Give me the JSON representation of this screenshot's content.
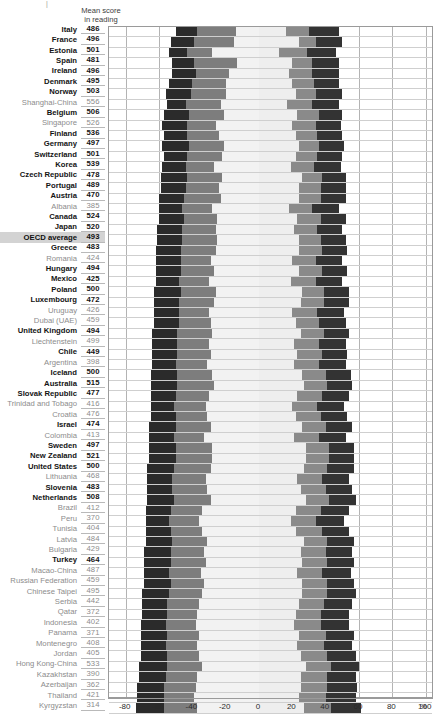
{
  "header": {
    "column_header_line1": "Mean score",
    "column_header_line2": "in reading",
    "corner_mark": "|"
  },
  "axis": {
    "unit_label": "%",
    "ticks": [
      "-80",
      "-60",
      "-40",
      "-20",
      "0",
      "20",
      "40",
      "60",
      "80",
      "100"
    ],
    "min": -90,
    "max": 105
  },
  "chart_data": {
    "type": "bar",
    "title": "Mean score in reading",
    "xlabel": "%",
    "ylabel": "",
    "xlim": [
      -90,
      105
    ],
    "grid": true,
    "legend_position": "none",
    "stacked": "diverging",
    "categories": [
      "Italy",
      "France",
      "Estonia",
      "Spain",
      "Ireland",
      "Denmark",
      "Norway",
      "Shanghai-China",
      "Belgium",
      "Singapore",
      "Finland",
      "Germany",
      "Switzerland",
      "Korea",
      "Czech Republic",
      "Portugal",
      "Austria",
      "Albania",
      "Canada",
      "Japan",
      "OECD average",
      "Greece",
      "Romania",
      "Hungary",
      "Mexico",
      "Poland",
      "Luxembourg",
      "Uruguay",
      "Dubai (UAE)",
      "United Kingdom",
      "Liechtenstein",
      "Chile",
      "Argentina",
      "Iceland",
      "Australia",
      "Slovak Republic",
      "Trinidad and Tobago",
      "Croatia",
      "Israel",
      "Colombia",
      "Sweden",
      "New Zealand",
      "United States",
      "Lithuania",
      "Slovenia",
      "Netherlands",
      "Brazil",
      "Peru",
      "Tunisia",
      "Latvia",
      "Bulgaria",
      "Turkey",
      "Macao-China",
      "Russian Federation",
      "Chinese Taipei",
      "Serbia",
      "Qatar",
      "Indonesia",
      "Panama",
      "Montenegro",
      "Jordan",
      "Hong Kong-China",
      "Kazakhstan",
      "Azerbaijan",
      "Thailand",
      "Kyrgyzstan"
    ],
    "mean_score_in_reading": [
      486,
      496,
      501,
      481,
      496,
      495,
      503,
      556,
      506,
      526,
      536,
      497,
      501,
      539,
      478,
      489,
      470,
      385,
      524,
      520,
      493,
      483,
      424,
      494,
      425,
      500,
      472,
      426,
      459,
      494,
      499,
      449,
      398,
      500,
      515,
      477,
      416,
      476,
      474,
      413,
      497,
      521,
      500,
      468,
      483,
      508,
      412,
      370,
      404,
      484,
      429,
      464,
      487,
      459,
      495,
      442,
      372,
      402,
      371,
      408,
      405,
      533,
      390,
      362,
      421,
      314
    ],
    "series": [
      {
        "name": "left-outer-dark",
        "key": "L1"
      },
      {
        "name": "left-inner-gray",
        "key": "L2"
      },
      {
        "name": "left-light",
        "key": "L3"
      },
      {
        "name": "right-light",
        "key": "R1"
      },
      {
        "name": "right-inner-gray",
        "key": "R2"
      },
      {
        "name": "right-outer-dark",
        "key": "R3"
      }
    ],
    "values": [
      [
        -50,
        -37,
        -14,
        16,
        30,
        48
      ],
      [
        -53,
        -39,
        -15,
        24,
        34,
        50
      ],
      [
        -54,
        -43,
        -28,
        12,
        29,
        46
      ],
      [
        -52,
        -39,
        -13,
        20,
        32,
        48
      ],
      [
        -52,
        -38,
        -18,
        18,
        32,
        48
      ],
      [
        -54,
        -40,
        -20,
        20,
        33,
        48
      ],
      [
        -56,
        -41,
        -20,
        22,
        34,
        50
      ],
      [
        -55,
        -44,
        -23,
        17,
        32,
        48
      ],
      [
        -57,
        -42,
        -21,
        23,
        36,
        50
      ],
      [
        -58,
        -43,
        -26,
        20,
        34,
        49
      ],
      [
        -57,
        -43,
        -24,
        22,
        35,
        50
      ],
      [
        -58,
        -42,
        -21,
        24,
        36,
        51
      ],
      [
        -57,
        -43,
        -22,
        22,
        35,
        50
      ],
      [
        -58,
        -44,
        -27,
        19,
        33,
        49
      ],
      [
        -59,
        -43,
        -22,
        26,
        38,
        52
      ],
      [
        -59,
        -44,
        -24,
        24,
        37,
        52
      ],
      [
        -60,
        -45,
        -23,
        24,
        37,
        52
      ],
      [
        -60,
        -46,
        -28,
        18,
        32,
        48
      ],
      [
        -60,
        -45,
        -25,
        23,
        37,
        52
      ],
      [
        -61,
        -46,
        -26,
        21,
        35,
        50
      ],
      [
        -61,
        -46,
        -25,
        24,
        37,
        52
      ],
      [
        -62,
        -47,
        -26,
        24,
        38,
        53
      ],
      [
        -62,
        -47,
        -29,
        20,
        34,
        50
      ],
      [
        -62,
        -47,
        -27,
        24,
        38,
        53
      ],
      [
        -62,
        -48,
        -30,
        19,
        34,
        50
      ],
      [
        -63,
        -47,
        -26,
        26,
        39,
        54
      ],
      [
        -63,
        -48,
        -27,
        25,
        39,
        54
      ],
      [
        -63,
        -48,
        -30,
        20,
        35,
        51
      ],
      [
        -63,
        -48,
        -29,
        22,
        36,
        52
      ],
      [
        -64,
        -49,
        -28,
        25,
        39,
        54
      ],
      [
        -64,
        -49,
        -30,
        21,
        36,
        52
      ],
      [
        -64,
        -49,
        -29,
        23,
        38,
        53
      ],
      [
        -64,
        -50,
        -31,
        21,
        36,
        52
      ],
      [
        -65,
        -49,
        -28,
        26,
        40,
        55
      ],
      [
        -65,
        -49,
        -27,
        27,
        41,
        56
      ],
      [
        -65,
        -50,
        -30,
        23,
        38,
        54
      ],
      [
        -65,
        -51,
        -32,
        20,
        35,
        51
      ],
      [
        -65,
        -50,
        -31,
        22,
        37,
        53
      ],
      [
        -66,
        -50,
        -29,
        26,
        40,
        56
      ],
      [
        -66,
        -51,
        -33,
        21,
        36,
        52
      ],
      [
        -66,
        -50,
        -28,
        28,
        42,
        57
      ],
      [
        -66,
        -50,
        -28,
        28,
        42,
        57
      ],
      [
        -67,
        -51,
        -29,
        27,
        41,
        57
      ],
      [
        -67,
        -52,
        -32,
        23,
        38,
        54
      ],
      [
        -67,
        -52,
        -31,
        25,
        40,
        56
      ],
      [
        -67,
        -51,
        -29,
        28,
        42,
        58
      ],
      [
        -68,
        -53,
        -34,
        22,
        37,
        54
      ],
      [
        -68,
        -54,
        -36,
        19,
        34,
        51
      ],
      [
        -68,
        -53,
        -34,
        22,
        38,
        54
      ],
      [
        -68,
        -52,
        -31,
        27,
        41,
        57
      ],
      [
        -69,
        -53,
        -33,
        25,
        40,
        56
      ],
      [
        -69,
        -53,
        -32,
        26,
        41,
        57
      ],
      [
        -69,
        -54,
        -35,
        23,
        38,
        55
      ],
      [
        -69,
        -53,
        -33,
        26,
        41,
        57
      ],
      [
        -70,
        -54,
        -34,
        26,
        41,
        58
      ],
      [
        -70,
        -55,
        -36,
        24,
        39,
        56
      ],
      [
        -70,
        -55,
        -37,
        22,
        37,
        54
      ],
      [
        -71,
        -56,
        -38,
        21,
        37,
        54
      ],
      [
        -71,
        -55,
        -36,
        24,
        40,
        57
      ],
      [
        -71,
        -56,
        -37,
        23,
        39,
        56
      ],
      [
        -71,
        -55,
        -36,
        25,
        41,
        58
      ],
      [
        -72,
        -55,
        -34,
        28,
        43,
        60
      ],
      [
        -72,
        -56,
        -37,
        25,
        41,
        58
      ],
      [
        -73,
        -57,
        -38,
        25,
        41,
        59
      ],
      [
        -73,
        -57,
        -39,
        24,
        40,
        58
      ],
      [
        -74,
        -57,
        -37,
        27,
        43,
        61
      ]
    ]
  }
}
